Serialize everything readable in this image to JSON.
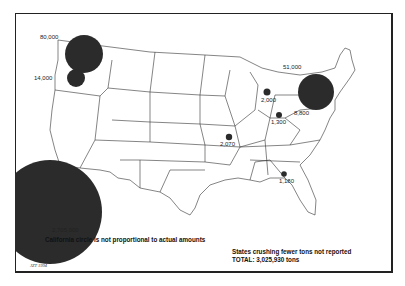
{
  "map": {
    "region": "Contiguous United States",
    "circle_color": "#2b2b2b",
    "outline_color": "#333333",
    "data_points": [
      {
        "id": "california",
        "label": "2,705,000",
        "value": 2705000
      },
      {
        "id": "washington",
        "label": "80,000",
        "value": 80000
      },
      {
        "id": "oregon",
        "label": "14,000",
        "value": 14000
      },
      {
        "id": "new-york",
        "label": "51,000",
        "value": 51000
      },
      {
        "id": "pennsylvania",
        "label": "8,800",
        "value": 8800
      },
      {
        "id": "michigan",
        "label": "2,000",
        "value": 2000
      },
      {
        "id": "ohio",
        "label": "1,300",
        "value": 1300
      },
      {
        "id": "missouri",
        "label": "2,070",
        "value": 2070
      },
      {
        "id": "georgia",
        "label": "1,180",
        "value": 1180
      }
    ]
  },
  "notes": {
    "california_note": "California circle is not proportional to actual amounts",
    "states_note": "States crushing fewer tons not reported",
    "total": "TOTAL: 3,025,930 tons"
  },
  "credit": "JZT 1994"
}
